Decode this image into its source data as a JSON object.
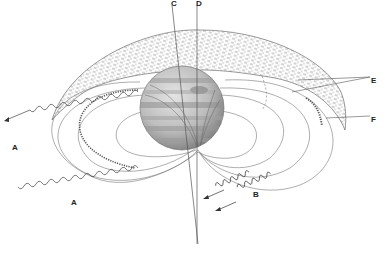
{
  "diagram": {
    "colors": {
      "line": "#555555",
      "belt_hatch": "#666666",
      "planet_light": "#d8d8d8",
      "planet_dark": "#8a8a8a",
      "background": "#ffffff"
    },
    "labels": {
      "A1": "A",
      "A2": "A",
      "B": "B",
      "C": "C",
      "D": "D",
      "E": "E",
      "F": "F"
    }
  }
}
